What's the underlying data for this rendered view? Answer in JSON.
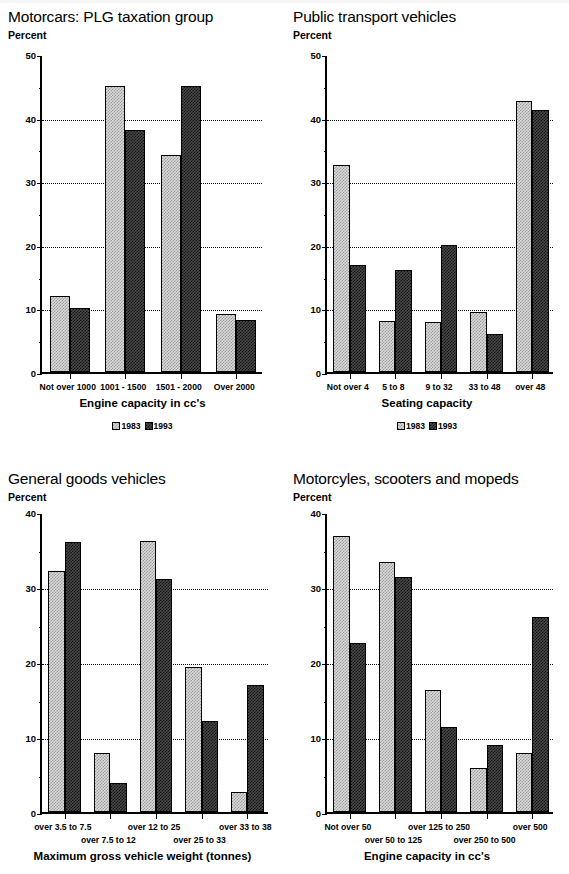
{
  "legend": {
    "series": [
      "1983",
      "1993"
    ]
  },
  "axis_unit_label": "Percent",
  "chart_data": [
    {
      "type": "bar",
      "title": "Motorcars: PLG taxation group",
      "ylabel": "Percent",
      "xlabel": "Engine capacity in cc's",
      "categories": [
        "Not over 1000",
        "1001 - 1500",
        "1501 - 2000",
        "Over 2000"
      ],
      "series": [
        {
          "name": "1983",
          "values": [
            12,
            45,
            34.2,
            9.2
          ]
        },
        {
          "name": "1993",
          "values": [
            10,
            38,
            45,
            8.1
          ]
        }
      ],
      "ylim": [
        0,
        50
      ],
      "yticks": [
        0,
        10,
        20,
        30,
        40,
        50
      ],
      "yticks_minor": [
        5,
        15,
        25,
        35,
        45
      ],
      "grid": true,
      "legend_position": "bottom-center",
      "label_rows": 1
    },
    {
      "type": "bar",
      "title": "Public transport vehicles",
      "ylabel": "Percent",
      "xlabel": "Seating capacity",
      "categories": [
        "Not over 4",
        "5 to 8",
        "9 to 32",
        "33 to 48",
        "over 48"
      ],
      "series": [
        {
          "name": "1983",
          "values": [
            32.5,
            8,
            7.9,
            9.4,
            42.6
          ]
        },
        {
          "name": "1993",
          "values": [
            16.8,
            16,
            20,
            6,
            41.2
          ]
        }
      ],
      "ylim": [
        0,
        50
      ],
      "yticks": [
        0,
        10,
        20,
        30,
        40,
        50
      ],
      "yticks_minor": [
        5,
        15,
        25,
        35,
        45
      ],
      "grid": true,
      "legend_position": "bottom-center",
      "label_rows": 1
    },
    {
      "type": "bar",
      "title": "General goods vehicles",
      "ylabel": "Percent",
      "xlabel": "Maximum gross vehicle weight (tonnes)",
      "categories": [
        "over 3.5 to 7.5",
        "over 7.5 to 12",
        "over 12 to 25",
        "over 25 to 33",
        "over 33 to 38"
      ],
      "series": [
        {
          "name": "1983",
          "values": [
            32.2,
            7.9,
            36.1,
            19.4,
            2.7
          ]
        },
        {
          "name": "1993",
          "values": [
            36,
            3.9,
            31.1,
            12.2,
            17
          ]
        }
      ],
      "ylim": [
        0,
        40
      ],
      "yticks": [
        0,
        10,
        20,
        30,
        40
      ],
      "yticks_minor": [
        5,
        15,
        25,
        35
      ],
      "grid": true,
      "legend_position": "none",
      "label_rows": 2
    },
    {
      "type": "bar",
      "title": "Motorcyles, scooters and mopeds",
      "ylabel": "Percent",
      "xlabel": "Engine capacity in cc's",
      "categories": [
        "Not over 50",
        "over 50 to 125",
        "over 125 to 250",
        "over 250 to 500",
        "over 500"
      ],
      "series": [
        {
          "name": "1983",
          "values": [
            36.8,
            33.4,
            16.3,
            5.9,
            7.9
          ]
        },
        {
          "name": "1993",
          "values": [
            22.5,
            31.4,
            11.3,
            8.9,
            26
          ]
        }
      ],
      "ylim": [
        0,
        40
      ],
      "yticks": [
        0,
        10,
        20,
        30,
        40
      ],
      "yticks_minor": [
        5,
        15,
        25,
        35
      ],
      "grid": true,
      "legend_position": "none",
      "label_rows": 2
    }
  ]
}
